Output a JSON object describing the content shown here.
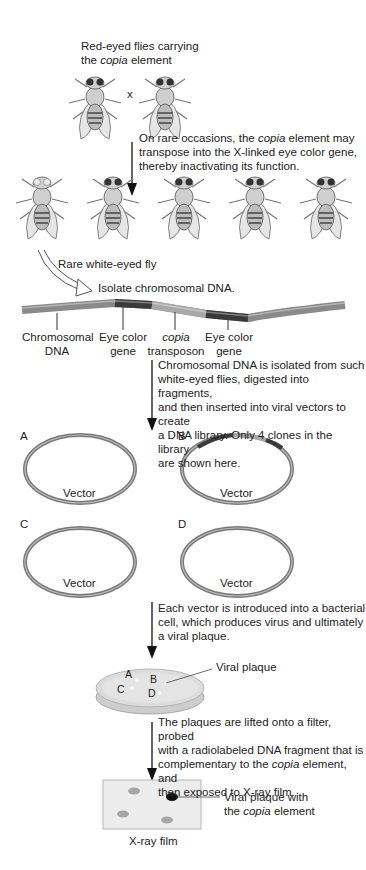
{
  "step1": {
    "line1": "Red-eyed flies carrying",
    "line2_pre": "the ",
    "line2_italic": "copia",
    "line2_post": " element",
    "cross_symbol": "x"
  },
  "step2": {
    "line1_pre": "On rare occasions, the ",
    "line1_italic": "copia",
    "line1_post": " element may",
    "line2": "transpose into the X-linked eye color gene,",
    "line3": "thereby inactivating its function."
  },
  "white_eyed_label": "Rare white-eyed fly",
  "isolate_label": "Isolate chromosomal DNA.",
  "dna_labels": [
    {
      "l1": "Chromosomal",
      "l2": "DNA"
    },
    {
      "l1": "Eye color",
      "l2": "gene"
    },
    {
      "l1": "copia",
      "l2": "transposon"
    },
    {
      "l1": "Eye color",
      "l2": "gene"
    }
  ],
  "step3": {
    "lines": [
      "Chromosomal DNA is isolated from such",
      "white-eyed flies, digested into fragments,",
      "and then inserted into viral vectors to create",
      "a DNA library. Only 4 clones in the library",
      "are shown here."
    ]
  },
  "vectors": [
    {
      "letter": "A",
      "label": "Vector"
    },
    {
      "letter": "B",
      "label": "Vector"
    },
    {
      "letter": "C",
      "label": "Vector"
    },
    {
      "letter": "D",
      "label": "Vector"
    }
  ],
  "step4": {
    "lines": [
      "Each vector is introduced into a bacterial",
      "cell, which produces virus and ultimately",
      "a viral plaque."
    ]
  },
  "plate": {
    "letters": [
      "A",
      "B",
      "C",
      "D"
    ],
    "callout": "Viral plaque"
  },
  "step5": {
    "line1": "The plaques are lifted onto a filter, probed",
    "line2": "with a radiolabeled DNA fragment that is",
    "line3_pre": "complementary to the ",
    "line3_italic": "copia",
    "line3_post": " element, and",
    "line4": "then exposed to X-ray film."
  },
  "film": {
    "label": "X-ray film",
    "callout_line1": "Viral plaque with",
    "callout_line2_pre": "the ",
    "callout_line2_italic": "copia",
    "callout_line2_post": " element"
  },
  "colors": {
    "dna_normal": "#8a8a8a",
    "eye_gene": "#3a3a3a",
    "copia": "#a8a8a8",
    "arrow": "#111111"
  }
}
